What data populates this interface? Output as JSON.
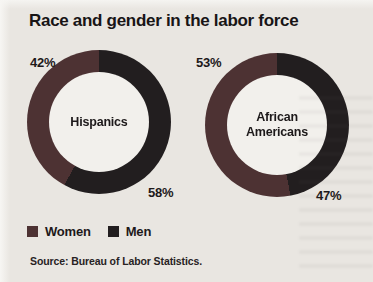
{
  "title": "Race and gender in the labor force",
  "source": "Source: Bureau of Labor Statistics.",
  "legend": {
    "items": [
      {
        "label": "Women",
        "color": "#4d3233"
      },
      {
        "label": "Men",
        "color": "#221e1f"
      }
    ]
  },
  "chart_data": {
    "type": "pie",
    "subtype": "donut",
    "title": "Race and gender in the labor force",
    "source": "Source: Bureau of Labor Statistics.",
    "legend_position": "bottom-left",
    "series_colors": {
      "Women": "#4d3233",
      "Men": "#221e1f"
    },
    "hole_color": "#f2f0ec",
    "layout_hint": "Women slice starts at 12 o'clock sweeping counterclockwise; Men slice sweeps clockwise from 12 o'clock",
    "charts": [
      {
        "category": "Hispanics",
        "center_label": "Hispanics",
        "slices": [
          {
            "name": "Women",
            "value_pct": 42,
            "label": "42%",
            "label_position": "upper-left"
          },
          {
            "name": "Men",
            "value_pct": 58,
            "label": "58%",
            "label_position": "lower-right"
          }
        ]
      },
      {
        "category": "African Americans",
        "center_label": "African\nAmericans",
        "slices": [
          {
            "name": "Women",
            "value_pct": 53,
            "label": "53%",
            "label_position": "upper-left"
          },
          {
            "name": "Men",
            "value_pct": 47,
            "label": "47%",
            "label_position": "lower-right"
          }
        ]
      }
    ]
  }
}
